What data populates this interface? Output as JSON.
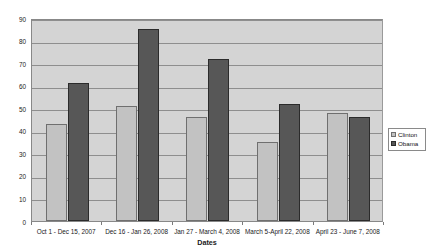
{
  "chart_data": {
    "type": "bar",
    "title": "",
    "xlabel": "Dates",
    "ylabel": "Percentage of Positive Coverage",
    "ylim": [
      0,
      90
    ],
    "ytick_step": 10,
    "yticks": [
      90,
      80,
      70,
      60,
      50,
      40,
      30,
      20,
      10,
      0
    ],
    "grid": true,
    "legend_position": "right",
    "categories": [
      "Oct 1 - Dec 15, 2007",
      "Dec 16 - Jan 26, 2008",
      "Jan 27 - March 4, 2008",
      "March 5-April 22, 2008",
      "April 23 - June 7, 2008"
    ],
    "series": [
      {
        "name": "Clinton",
        "color": "#c2c2c2",
        "values": [
          43,
          51,
          46,
          35,
          48
        ]
      },
      {
        "name": "Obama",
        "color": "#575757",
        "values": [
          61,
          85,
          72,
          52,
          46
        ]
      }
    ]
  },
  "legend": {
    "items": [
      {
        "label": "Clinton"
      },
      {
        "label": "Obama"
      }
    ]
  }
}
